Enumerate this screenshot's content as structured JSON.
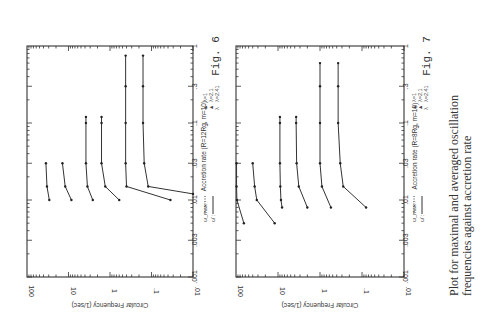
{
  "caption_lines": [
    "Plot for maximal and averaged oscillation",
    "frequencies against accretion rate"
  ],
  "chart_data": [
    {
      "type": "line",
      "title": "Fig. 6",
      "figure_label": "Fig. 6",
      "orientation": "rotated-90",
      "xlabel": "Accretion rate (R=12Rg, m=10)",
      "ylabel": "Circular Frequency (1/sec)",
      "xscale": "log",
      "yscale": "log",
      "xlim": [
        0.001,
        1
      ],
      "ylim": [
        0.01,
        100
      ],
      "x_ticks": [
        ".001",
        ".003",
        ".01",
        ".03",
        ".1",
        ".3",
        "1"
      ],
      "y_ticks": [
        "100",
        "10",
        "1",
        ".1",
        ".01"
      ],
      "legend": {
        "styles": [
          {
            "label": "ω_max :",
            "style": "dotted"
          },
          {
            "label": "ω̄ :",
            "style": "solid"
          }
        ],
        "lambdas": [
          {
            "marker": "▲",
            "label": "λ=1"
          },
          {
            "marker": "▲",
            "label": "λ=2.1"
          },
          {
            "marker": "λ",
            "label": "λ=2.41"
          }
        ]
      },
      "series": [
        {
          "name": "curve-1",
          "x": [
            0.03,
            0.015,
            0.01
          ],
          "y": [
            35,
            33,
            29
          ]
        },
        {
          "name": "curve-2",
          "x": [
            0.03,
            0.015,
            0.01
          ],
          "y": [
            14,
            12,
            8.5
          ]
        },
        {
          "name": "curve-3",
          "x": [
            0.12,
            0.1,
            0.03,
            0.015,
            0.01
          ],
          "y": [
            3.8,
            3.8,
            3.8,
            3.5,
            2.6
          ]
        },
        {
          "name": "curve-4",
          "x": [
            0.12,
            0.1,
            0.03,
            0.015,
            0.01
          ],
          "y": [
            1.6,
            1.6,
            1.6,
            1.3,
            0.6
          ]
        },
        {
          "name": "curve-5",
          "x": [
            0.75,
            0.3,
            0.1,
            0.03,
            0.015,
            0.01
          ],
          "y": [
            0.42,
            0.42,
            0.42,
            0.42,
            0.4,
            0.035
          ]
        },
        {
          "name": "curve-6",
          "x": [
            0.75,
            0.3,
            0.1,
            0.03,
            0.015,
            0.012
          ],
          "y": [
            0.16,
            0.16,
            0.16,
            0.15,
            0.12,
            0.01
          ]
        }
      ]
    },
    {
      "type": "line",
      "title": "Fig. 7",
      "figure_label": "Fig. 7",
      "orientation": "rotated-90",
      "xlabel": "Accretion rate (R=8Rg, m=10)",
      "ylabel": "Circular Frequency (1/sec)",
      "xscale": "log",
      "yscale": "log",
      "xlim": [
        0.001,
        1
      ],
      "ylim": [
        0.01,
        100
      ],
      "x_ticks": [
        ".001",
        ".003",
        ".01",
        ".03",
        ".1",
        ".3",
        "1"
      ],
      "y_ticks": [
        "100",
        "10",
        "1",
        ".1",
        ".01"
      ],
      "legend": {
        "styles": [
          {
            "label": "ω_max :",
            "style": "dotted"
          },
          {
            "label": "ω̄ :",
            "style": "solid"
          }
        ],
        "lambdas": [
          {
            "marker": "▲",
            "label": "λ=1"
          },
          {
            "marker": "▲",
            "label": "λ=2.1"
          },
          {
            "marker": "λ",
            "label": "λ=2.41"
          }
        ]
      },
      "series": [
        {
          "name": "curve-1",
          "x": [
            0.03,
            0.015,
            0.01,
            0.005
          ],
          "y": [
            97,
            97,
            95,
            65
          ]
        },
        {
          "name": "curve-2",
          "x": [
            0.03,
            0.015,
            0.01,
            0.005
          ],
          "y": [
            40,
            36,
            32,
            12
          ]
        },
        {
          "name": "curve-3",
          "x": [
            0.12,
            0.1,
            0.03,
            0.015,
            0.01,
            0.008
          ],
          "y": [
            9,
            9,
            9,
            8.8,
            8.5,
            8
          ]
        },
        {
          "name": "curve-4",
          "x": [
            0.12,
            0.1,
            0.03,
            0.015,
            0.008
          ],
          "y": [
            3.7,
            3.7,
            3.6,
            3.2,
            2.0
          ]
        },
        {
          "name": "curve-5",
          "x": [
            0.6,
            0.3,
            0.1,
            0.03,
            0.015,
            0.008
          ],
          "y": [
            1.0,
            1.0,
            1.0,
            1.0,
            0.9,
            0.55
          ]
        },
        {
          "name": "curve-6",
          "x": [
            0.6,
            0.3,
            0.1,
            0.03,
            0.015,
            0.008
          ],
          "y": [
            0.37,
            0.37,
            0.37,
            0.33,
            0.28,
            0.08
          ]
        }
      ]
    }
  ]
}
